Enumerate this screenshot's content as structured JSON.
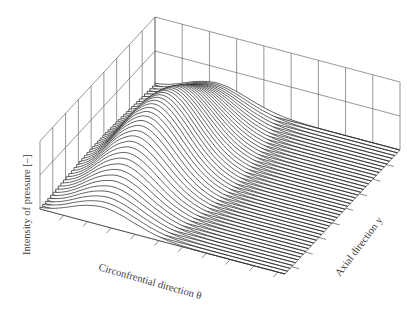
{
  "chart_data": {
    "type": "surface-3d-waterfall",
    "title": "",
    "zlabel": "Intensity of pressure [–]",
    "xlabel": "Circonfrential direction θ",
    "ylabel": "Axial direction y",
    "grid": true,
    "wall_gridlines": {
      "left_wall_vertical": 9,
      "right_wall_vertical": 9,
      "horizontal": 2
    },
    "x_ticks": 10,
    "y_ticks": 8,
    "num_slices": 44,
    "profile_description": "Pressure rises along circumferential direction to a single peak near the back wall, peak maximum at the middle of the axial direction, decaying toward both axial ends; flat near-zero plateau over the remaining circumferential range",
    "peak": {
      "theta_fraction": 0.35,
      "y_fraction": 0.5,
      "z_fraction": 1.0
    },
    "colors": {
      "line": "#2e2e2e",
      "grid": "#6a6a6a",
      "background": "#ffffff",
      "text": "#3a3a3a"
    }
  },
  "labels": {
    "z_axis": "Intensity of pressure [–]",
    "x_axis": "Circonfrential direction θ",
    "y_axis": "Axial direction y"
  },
  "geometry": {
    "left_corner": [
      40,
      209
    ],
    "back_corner": [
      155,
      85
    ],
    "right_corner": [
      400,
      150
    ],
    "front_corner": [
      284,
      305
    ],
    "wall_height": 68
  }
}
